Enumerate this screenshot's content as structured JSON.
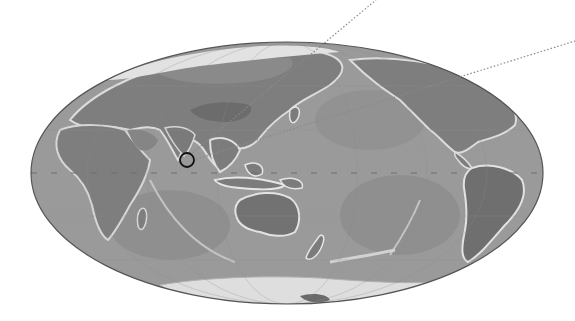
{
  "map": {
    "projection": "hammer-ellipse",
    "center_meridian": "Indian/Pacific",
    "colors": {
      "background": "#ffffff",
      "ocean": "#9a9a9a",
      "ocean_deep": "#8c8c8c",
      "shelf": "#d9d9d9",
      "land": "#7e7e7e",
      "land_high": "#6a6a6a",
      "ice": "#e6e6e6",
      "outline": "#555555",
      "marker": "#111111",
      "dotted_line": "#8a8a8a",
      "equator": "#6e6e6e"
    },
    "ellipse": {
      "cx": 287,
      "cy": 173,
      "rx": 256,
      "ry": 131
    },
    "marker": {
      "label": "Sri Lanka",
      "cx": 187,
      "cy": 160,
      "r": 7
    },
    "lines": [
      {
        "name": "line-north",
        "x1": 190,
        "y1": 155,
        "x2": 376,
        "y2": 0
      },
      {
        "name": "line-east",
        "x1": 193,
        "y1": 160,
        "x2": 575,
        "y2": 41
      }
    ],
    "equator_y": 173
  }
}
